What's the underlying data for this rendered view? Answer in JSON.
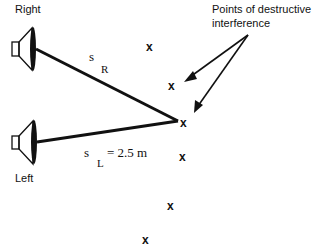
{
  "labels": {
    "right_speaker": "Right",
    "left_speaker": "Left",
    "annotation_line1": "Points of destructive",
    "annotation_line2": "interference"
  },
  "distances": {
    "s_right_symbol": "s",
    "s_right_subscript": "R",
    "s_left_symbol": "s",
    "s_left_subscript": "L",
    "s_left_value": "= 2.5 m"
  },
  "marks": [
    {
      "symbol": "x",
      "x": 150,
      "y": 47
    },
    {
      "symbol": "x",
      "x": 172,
      "y": 86
    },
    {
      "symbol": "x",
      "x": 184,
      "y": 124
    },
    {
      "symbol": "x",
      "x": 183,
      "y": 158
    },
    {
      "symbol": "x",
      "x": 171,
      "y": 206
    },
    {
      "symbol": "x",
      "x": 146,
      "y": 240
    }
  ],
  "colors": {
    "ink": "#111111",
    "background": "#ffffff"
  }
}
